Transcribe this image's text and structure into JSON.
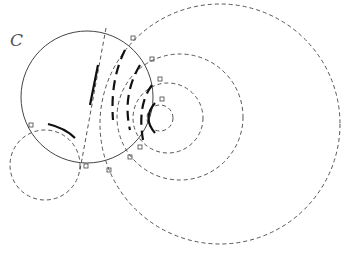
{
  "diagram": {
    "label": "C",
    "main_circle": {
      "cx": 87,
      "cy": 97,
      "r": 66
    },
    "dashed_circles": [
      {
        "cx": 220,
        "cy": 124,
        "r": 120
      },
      {
        "cx": 180,
        "cy": 117,
        "r": 63
      },
      {
        "cx": 168,
        "cy": 118,
        "r": 35
      },
      {
        "cx": 160,
        "cy": 118,
        "r": 13
      },
      {
        "cx": 45,
        "cy": 165,
        "r": 35
      }
    ],
    "colors": {
      "stroke": "#444444",
      "bold": "#111111"
    }
  }
}
